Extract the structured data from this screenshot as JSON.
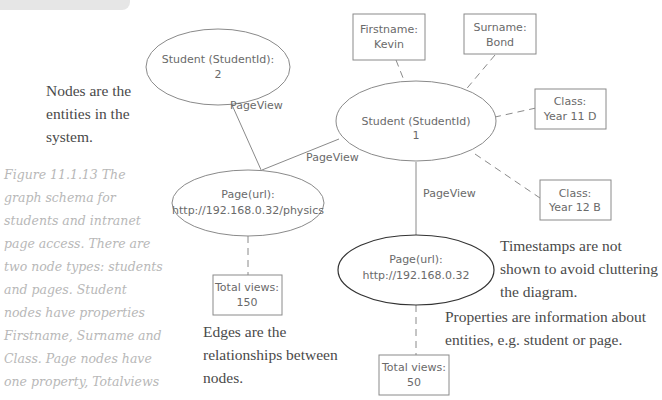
{
  "caption": {
    "text": "Figure 11.1.13 The graph schema for students and intranet page access. There are two node types: students and pages. Student nodes have properties Firstname, Surname and Class. Page nodes have one property, Totalviews"
  },
  "notes": {
    "nodes": "Nodes are the entities in the system.",
    "edges": "Edges are the relationships between nodes.",
    "timestamps": "Timestamps are not shown to avoid cluttering the diagram.",
    "properties": "Properties are information about entities, e.g. student or page."
  },
  "nodes": {
    "student2": {
      "line1": "Student (StudentId):",
      "line2": "2"
    },
    "student1": {
      "line1": "Student (StudentId)",
      "line2": "1"
    },
    "page_physics": {
      "line1": "Page(url):",
      "line2": "http://192.168.0.32/physics"
    },
    "page_root": {
      "line1": "Page(url):",
      "line2": "http://192.168.0.32"
    }
  },
  "properties": {
    "firstname": {
      "line1": "Firstname:",
      "line2": "Kevin"
    },
    "surname": {
      "line1": "Surname:",
      "line2": "Bond"
    },
    "class1": {
      "line1": "Class:",
      "line2": "Year 11 D"
    },
    "class2": {
      "line1": "Class:",
      "line2": "Year 12 B"
    },
    "views_physics": {
      "line1": "Total views:",
      "line2": "150"
    },
    "views_root": {
      "line1": "Total views:",
      "line2": "50"
    }
  },
  "edges": {
    "s2_physics": "PageView",
    "s1_physics": "PageView",
    "s1_root": "PageView"
  },
  "colors": {
    "line": "#8a8a8a",
    "highlight_ellipse": "#333333",
    "caption": "#b8b8b8",
    "note": "#4a4a4a"
  }
}
